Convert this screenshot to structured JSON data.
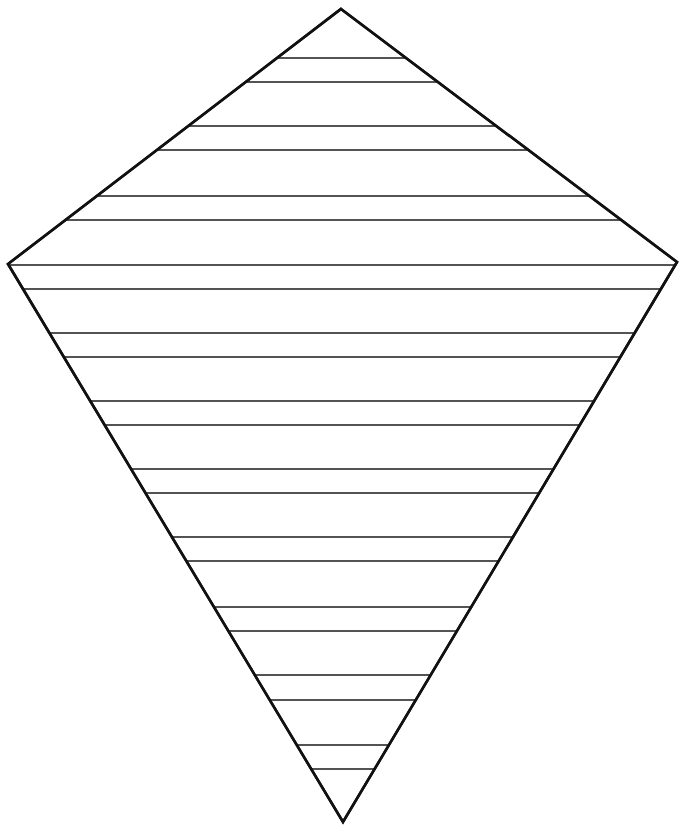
{
  "figure": {
    "type": "kite writing template",
    "width": 689,
    "height": 833,
    "colors": {
      "background": "#ffffff",
      "outline": "#111111",
      "lines": "#1a1a1a"
    },
    "kite": {
      "vertices": {
        "top": [
          341,
          9
        ],
        "right": [
          677,
          262
        ],
        "bottom": [
          343,
          822
        ],
        "left": [
          8,
          264
        ]
      }
    },
    "writing_lines_y": [
      58,
      82,
      126,
      150,
      196,
      220,
      265,
      289,
      333,
      357,
      401,
      425,
      469,
      493,
      537,
      561,
      607,
      631,
      675,
      700,
      745,
      769
    ]
  }
}
